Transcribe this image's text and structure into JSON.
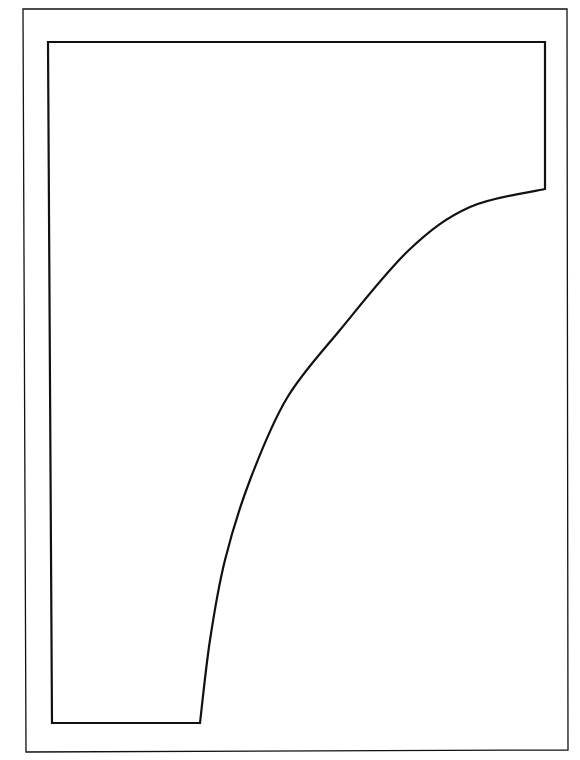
{
  "diagram": {
    "type": "line-drawing",
    "background": "#ffffff",
    "stroke": "#111111",
    "frame": {
      "points": [
        [
          23,
          9
        ],
        [
          567,
          9
        ],
        [
          568,
          750
        ],
        [
          26,
          752
        ]
      ],
      "stroke_width": 1.3
    },
    "shape": {
      "description": "Template outline: rectangle with a concave curved cut from the upper right edge down to the bottom edge",
      "top_left": [
        48,
        42
      ],
      "top_right": [
        545,
        42
      ],
      "right_curve_start": [
        545,
        189
      ],
      "curve_points": [
        [
          545,
          189
        ],
        [
          470,
          207
        ],
        [
          409,
          250
        ],
        [
          340,
          330
        ],
        [
          287,
          398
        ],
        [
          250,
          480
        ],
        [
          225,
          560
        ],
        [
          210,
          640
        ],
        [
          200,
          723
        ]
      ],
      "bottom_right": [
        200,
        723
      ],
      "bottom_left": [
        52,
        723
      ],
      "stroke_width": 2.2
    }
  }
}
